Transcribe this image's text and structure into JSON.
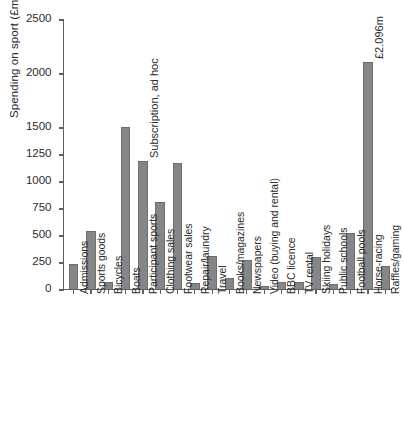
{
  "chart_data": {
    "type": "bar",
    "title": "",
    "xlabel": "",
    "ylabel": "Spending on sport (£m)",
    "ylim": [
      0,
      2500
    ],
    "grid": false,
    "legend": null,
    "ytick_labels": [
      "0",
      "250",
      "500",
      "750",
      "1000",
      "1250",
      "1500",
      "2000",
      "2500"
    ],
    "ytick_values": [
      0,
      250,
      500,
      750,
      1000,
      1250,
      1500,
      2000,
      2500
    ],
    "categories": [
      "Admissions",
      "Sports goods",
      "Bicycles",
      "Boats",
      "Participant sports",
      "Clothing sales",
      "Footwear sales",
      "Repair/laundry",
      "Travel",
      "Books/magazines",
      "Newspapers",
      "Video (buying and rental)",
      "BBC licence",
      "TV rental",
      "Skiing holidays",
      "Public schools",
      "Football pools",
      "Horse-racing",
      "Raffles/gaming"
    ],
    "values": [
      230,
      530,
      65,
      1495,
      1180,
      805,
      1165,
      50,
      300,
      95,
      270,
      25,
      60,
      60,
      295,
      45,
      520,
      2096,
      210
    ],
    "annotations": [
      {
        "text": "Subscription, ad hoc",
        "category": "Participant sports"
      },
      {
        "text": "£2.096m",
        "category": "Horse-racing"
      }
    ],
    "bar_color": "#868686",
    "axis_color": "#5f5f5f",
    "text_color": "#2b2b2b"
  }
}
